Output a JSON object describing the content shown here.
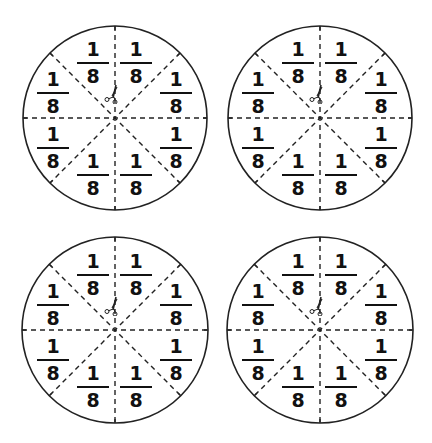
{
  "sheet": {
    "title": "Fraction circles - eighths",
    "colors": {
      "stroke": "#222222",
      "text": "#111111",
      "background": "#ffffff"
    },
    "circles": [
      {
        "id": "circle-1",
        "center": [
          115,
          118
        ],
        "radius": 92,
        "icons": [
          "scissors-icon"
        ],
        "pieces": [
          {
            "numerator": "1",
            "denominator": "8"
          },
          {
            "numerator": "1",
            "denominator": "8"
          },
          {
            "numerator": "1",
            "denominator": "8"
          },
          {
            "numerator": "1",
            "denominator": "8"
          },
          {
            "numerator": "1",
            "denominator": "8"
          },
          {
            "numerator": "1",
            "denominator": "8"
          },
          {
            "numerator": "1",
            "denominator": "8"
          },
          {
            "numerator": "1",
            "denominator": "8"
          }
        ]
      },
      {
        "id": "circle-2",
        "center": [
          320,
          118
        ],
        "radius": 92,
        "icons": [
          "scissors-icon"
        ],
        "pieces": [
          {
            "numerator": "1",
            "denominator": "8"
          },
          {
            "numerator": "1",
            "denominator": "8"
          },
          {
            "numerator": "1",
            "denominator": "8"
          },
          {
            "numerator": "1",
            "denominator": "8"
          },
          {
            "numerator": "1",
            "denominator": "8"
          },
          {
            "numerator": "1",
            "denominator": "8"
          },
          {
            "numerator": "1",
            "denominator": "8"
          },
          {
            "numerator": "1",
            "denominator": "8"
          }
        ]
      },
      {
        "id": "circle-3",
        "center": [
          115,
          330
        ],
        "radius": 93,
        "icons": [
          "scissors-icon"
        ],
        "pieces": [
          {
            "numerator": "1",
            "denominator": "8"
          },
          {
            "numerator": "1",
            "denominator": "8"
          },
          {
            "numerator": "1",
            "denominator": "8"
          },
          {
            "numerator": "1",
            "denominator": "8"
          },
          {
            "numerator": "1",
            "denominator": "8"
          },
          {
            "numerator": "1",
            "denominator": "8"
          },
          {
            "numerator": "1",
            "denominator": "8"
          },
          {
            "numerator": "1",
            "denominator": "8"
          }
        ]
      },
      {
        "id": "circle-4",
        "center": [
          320,
          330
        ],
        "radius": 93,
        "icons": [
          "scissors-icon"
        ],
        "pieces": [
          {
            "numerator": "1",
            "denominator": "8"
          },
          {
            "numerator": "1",
            "denominator": "8"
          },
          {
            "numerator": "1",
            "denominator": "8"
          },
          {
            "numerator": "1",
            "denominator": "8"
          },
          {
            "numerator": "1",
            "denominator": "8"
          },
          {
            "numerator": "1",
            "denominator": "8"
          },
          {
            "numerator": "1",
            "denominator": "8"
          },
          {
            "numerator": "1",
            "denominator": "8"
          }
        ]
      }
    ]
  }
}
